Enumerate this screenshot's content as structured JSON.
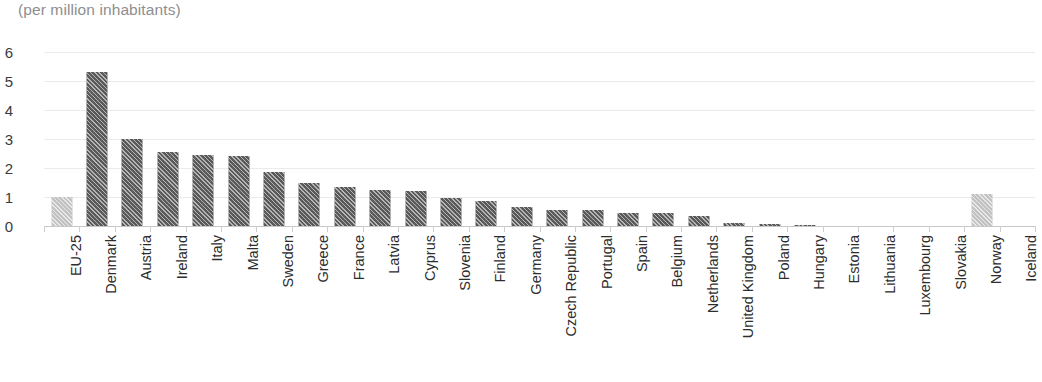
{
  "chart_data": {
    "type": "bar",
    "title": "(per million inhabitants)",
    "xlabel": "",
    "ylabel": "",
    "ylim": [
      0,
      6
    ],
    "yticks": [
      "0",
      "1",
      "2",
      "3",
      "4",
      "5",
      "6"
    ],
    "grid": true,
    "legend": "none",
    "orientation": "vertical",
    "tick_label_rotation": -90,
    "series_name": "per million inhabitants",
    "categories": [
      "EU-25",
      "Denmark",
      "Austria",
      "Ireland",
      "Italy",
      "Malta",
      "Sweden",
      "Greece",
      "France",
      "Latvia",
      "Cyprus",
      "Slovenia",
      "Finland",
      "Germany",
      "Czech Republic",
      "Portugal",
      "Spain",
      "Belgium",
      "Netherlands",
      "United Kingdom",
      "Poland",
      "Hungary",
      "Estonia",
      "Lithuania",
      "Luxembourg",
      "Slovakia",
      "Norway",
      "Iceland"
    ],
    "values": [
      1.0,
      5.3,
      3.0,
      2.55,
      2.45,
      2.4,
      1.85,
      1.5,
      1.35,
      1.25,
      1.2,
      0.95,
      0.85,
      0.65,
      0.55,
      0.55,
      0.45,
      0.45,
      0.35,
      0.12,
      0.06,
      0.04,
      0.0,
      0.0,
      0.0,
      0.0,
      1.1,
      0.0
    ],
    "highlight_categories": [
      "EU-25",
      "Norway"
    ],
    "colors": {
      "bar": "#5a5a5a",
      "bar_highlight": "#c2c2c2",
      "gridline": "#eceaea",
      "axis": "#c9c6c6",
      "tick_label": "#2d2d2d",
      "title": "#8e8e8e"
    }
  }
}
